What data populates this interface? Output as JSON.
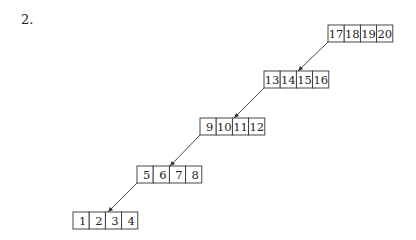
{
  "problem_label": "2.",
  "diagram": {
    "type": "linked-list-of-blocks",
    "cell_width": 16.2,
    "cell_height": 17,
    "nodes": [
      {
        "id": "n5",
        "x": 328,
        "y": 25,
        "keys": [
          "17",
          "18",
          "19",
          "20"
        ]
      },
      {
        "id": "n4",
        "x": 264,
        "y": 71,
        "keys": [
          "13",
          "14",
          "15",
          "16"
        ]
      },
      {
        "id": "n3",
        "x": 200,
        "y": 118,
        "keys": [
          "9",
          "10",
          "11",
          "12"
        ]
      },
      {
        "id": "n2",
        "x": 137,
        "y": 166,
        "keys": [
          "5",
          "6",
          "7",
          "8"
        ]
      },
      {
        "id": "n1",
        "x": 73,
        "y": 212,
        "keys": [
          "1",
          "2",
          "3",
          "4"
        ]
      }
    ],
    "edges": [
      {
        "from": "n5",
        "to": "n4",
        "x1": 328,
        "y1": 42,
        "x2": 298,
        "y2": 71
      },
      {
        "from": "n4",
        "to": "n3",
        "x1": 264,
        "y1": 88,
        "x2": 234,
        "y2": 118
      },
      {
        "from": "n3",
        "to": "n2",
        "x1": 200,
        "y1": 135,
        "x2": 170,
        "y2": 166
      },
      {
        "from": "n2",
        "to": "n1",
        "x1": 137,
        "y1": 183,
        "x2": 108,
        "y2": 212
      }
    ],
    "colors": {
      "stroke": "#333333",
      "text": "#222222",
      "background": "#ffffff"
    }
  }
}
